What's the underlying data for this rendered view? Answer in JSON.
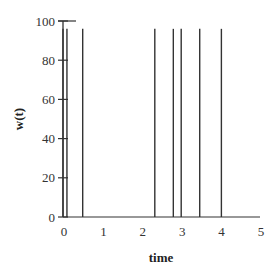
{
  "chart_data": {
    "type": "line",
    "title": "",
    "xlabel": "time",
    "ylabel": "w(t)",
    "xlim": [
      0,
      5
    ],
    "ylim": [
      0,
      100
    ],
    "x_ticks": [
      0,
      1,
      2,
      3,
      4,
      5
    ],
    "y_ticks": [
      0,
      20,
      40,
      60,
      80,
      100
    ],
    "grid": false,
    "legend": null,
    "series": [
      {
        "name": "w(t)",
        "description": "impulse-like spikes from 0 to ~96 at discrete times",
        "spike_times": [
          0.0,
          0.1,
          0.5,
          2.33,
          2.8,
          3.0,
          3.47,
          4.02
        ],
        "spike_height": 96,
        "baseline": 0,
        "color": "#333333"
      }
    ]
  },
  "labels": {
    "xlabel": "time",
    "ylabel": "w(t)",
    "x_ticks": [
      "0",
      "1",
      "2",
      "3",
      "4",
      "5"
    ],
    "y_ticks": [
      "0",
      "20",
      "40",
      "60",
      "80",
      "100"
    ]
  }
}
